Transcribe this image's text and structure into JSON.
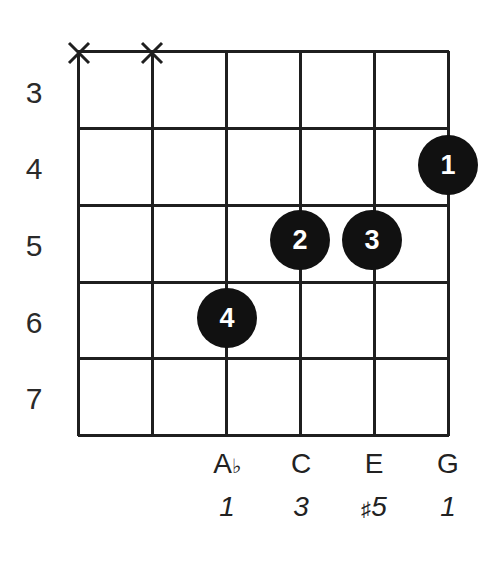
{
  "diagram": {
    "type": "guitar-chord-diagram",
    "strings": 6,
    "fret_labels": [
      "3",
      "4",
      "5",
      "6",
      "7"
    ],
    "muted_strings": [
      1,
      2
    ],
    "fingers": [
      {
        "finger": "1",
        "string": 6,
        "fret": "4"
      },
      {
        "finger": "2",
        "string": 4,
        "fret": "5"
      },
      {
        "finger": "3",
        "string": 5,
        "fret": "5"
      },
      {
        "finger": "4",
        "string": 3,
        "fret": "6"
      }
    ],
    "notes": [
      {
        "string": 3,
        "name": "A",
        "accidental": "♭",
        "interval": "1",
        "interval_accidental": ""
      },
      {
        "string": 4,
        "name": "C",
        "accidental": "",
        "interval": "3",
        "interval_accidental": ""
      },
      {
        "string": 5,
        "name": "E",
        "accidental": "",
        "interval": "5",
        "interval_accidental": "♯"
      },
      {
        "string": 6,
        "name": "G",
        "accidental": "",
        "interval": "1",
        "interval_accidental": ""
      }
    ],
    "colors": {
      "line": "#1f1f1f",
      "dot": "#111111",
      "dot_text": "#ffffff",
      "background": "#ffffff"
    }
  }
}
